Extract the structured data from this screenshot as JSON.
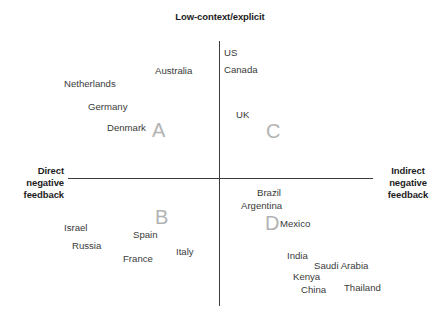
{
  "chart_data": {
    "type": "scatter",
    "title": "",
    "xlabel": "Direct negative feedback — Indirect negative feedback",
    "ylabel": "Low-context/explicit",
    "grid": false,
    "legend": "none",
    "axes": {
      "top_label": "Low-context/explicit",
      "left_label": "Direct\nnegative\nfeedback",
      "right_label": "Indirect\nnegative\nfeedback",
      "vertical_line_color": "#3c3c3c",
      "horizontal_line_color": "#3c3c3c"
    },
    "quadrants": [
      {
        "id": "A",
        "label": "A",
        "x": 152,
        "y": 120,
        "color": "#b3b3b3"
      },
      {
        "id": "B",
        "label": "B",
        "x": 155,
        "y": 207,
        "color": "#b3b3b3"
      },
      {
        "id": "C",
        "label": "C",
        "x": 266,
        "y": 121,
        "color": "#b3b3b3"
      },
      {
        "id": "D",
        "label": "D",
        "x": 265,
        "y": 213,
        "color": "#b3b3b3"
      }
    ],
    "points": [
      {
        "name": "Australia",
        "x": 155,
        "y": 66,
        "quadrant": "A"
      },
      {
        "name": "Netherlands",
        "x": 64,
        "y": 79,
        "quadrant": "A"
      },
      {
        "name": "Germany",
        "x": 88,
        "y": 102,
        "quadrant": "A"
      },
      {
        "name": "Denmark",
        "x": 107,
        "y": 123,
        "quadrant": "A"
      },
      {
        "name": "US",
        "x": 224,
        "y": 48,
        "quadrant": "C"
      },
      {
        "name": "Canada",
        "x": 224,
        "y": 65,
        "quadrant": "C"
      },
      {
        "name": "UK",
        "x": 236,
        "y": 110,
        "quadrant": "C"
      },
      {
        "name": "Israel",
        "x": 64,
        "y": 223,
        "quadrant": "B"
      },
      {
        "name": "Russia",
        "x": 72,
        "y": 241,
        "quadrant": "B"
      },
      {
        "name": "Spain",
        "x": 133,
        "y": 230,
        "quadrant": "B"
      },
      {
        "name": "France",
        "x": 123,
        "y": 254,
        "quadrant": "B"
      },
      {
        "name": "Italy",
        "x": 176,
        "y": 247,
        "quadrant": "B"
      },
      {
        "name": "Brazil",
        "x": 257,
        "y": 188,
        "quadrant": "D"
      },
      {
        "name": "Argentina",
        "x": 241,
        "y": 201,
        "quadrant": "D"
      },
      {
        "name": "Mexico",
        "x": 280,
        "y": 219,
        "quadrant": "D"
      },
      {
        "name": "India",
        "x": 287,
        "y": 251,
        "quadrant": "D"
      },
      {
        "name": "Saudi Arabia",
        "x": 314,
        "y": 261,
        "quadrant": "D"
      },
      {
        "name": "Kenya",
        "x": 293,
        "y": 272,
        "quadrant": "D"
      },
      {
        "name": "China",
        "x": 301,
        "y": 285,
        "quadrant": "D"
      },
      {
        "name": "Thailand",
        "x": 344,
        "y": 283,
        "quadrant": "D"
      }
    ]
  }
}
